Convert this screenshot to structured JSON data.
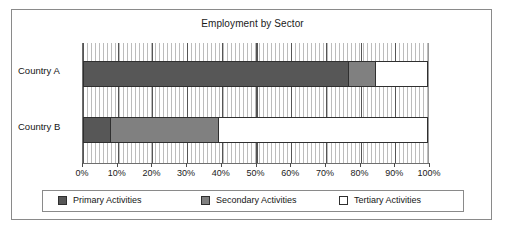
{
  "chart_data": {
    "type": "bar",
    "orientation": "horizontal",
    "stacked": true,
    "stacked_percent": true,
    "title": "Employment by Sector",
    "xlabel": "",
    "ylabel": "",
    "categories": [
      "Country A",
      "Country B"
    ],
    "series": [
      {
        "name": "Primary Activities",
        "values": [
          77,
          8
        ],
        "color": "#575757"
      },
      {
        "name": "Secondary Activities",
        "values": [
          8,
          31.5
        ],
        "color": "#808080"
      },
      {
        "name": "Tertiary Activities",
        "values": [
          15,
          60.5
        ],
        "color": "#ffffff"
      }
    ],
    "xlim": [
      0,
      100
    ],
    "xticks": [
      0,
      10,
      20,
      30,
      40,
      50,
      60,
      70,
      80,
      90,
      100
    ],
    "xticklabels": [
      "0%",
      "10%",
      "20%",
      "30%",
      "40%",
      "50%",
      "60%",
      "70%",
      "80%",
      "90%",
      "100%"
    ],
    "grid": true,
    "grid_axis": "x",
    "legend_position": "bottom",
    "plot_background": "hatched-vertical-lines",
    "colors": {
      "primary": "#575757",
      "secondary": "#808080",
      "tertiary": "#ffffff",
      "border": "#8a8a8a",
      "gridline": "#555555",
      "hatch": "#bcbcbc",
      "text": "#151515"
    }
  },
  "title": "Employment by Sector",
  "axis": {
    "ticklabels": [
      "0%",
      "10%",
      "20%",
      "30%",
      "40%",
      "50%",
      "60%",
      "70%",
      "80%",
      "90%",
      "100%"
    ]
  },
  "categories": [
    {
      "label": "Country A"
    },
    {
      "label": "Country B"
    }
  ],
  "legend": {
    "items": [
      {
        "label": "Primary Activities"
      },
      {
        "label": "Secondary Activities"
      },
      {
        "label": "Tertiary Activities"
      }
    ]
  }
}
